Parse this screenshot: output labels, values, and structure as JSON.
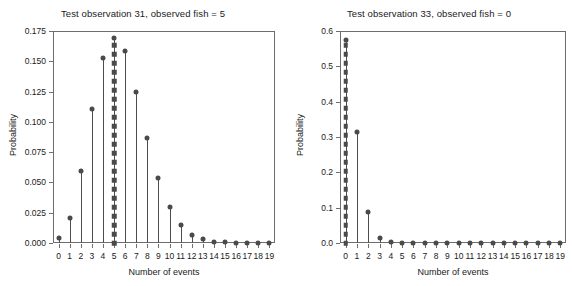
{
  "figure": {
    "width": 572,
    "height": 286,
    "background": "#ffffff",
    "marker_color": "#4a4a4a",
    "stem_color": "#4d4d4d",
    "frame_color": "#6e6e6e"
  },
  "chart_data": [
    {
      "type": "bar",
      "subtype": "stem",
      "title": "Test observation 31, observed fish = 5",
      "xlabel": "Number of events",
      "ylabel": "Probability",
      "grid": false,
      "legend": "none",
      "categories": [
        0,
        1,
        2,
        3,
        4,
        5,
        6,
        7,
        8,
        9,
        10,
        11,
        12,
        13,
        14,
        15,
        16,
        17,
        18,
        19
      ],
      "values": [
        0.0041,
        0.021,
        0.0595,
        0.111,
        0.153,
        0.1695,
        0.1585,
        0.125,
        0.0865,
        0.0535,
        0.0295,
        0.015,
        0.007,
        0.003,
        0.0012,
        0.0005,
        0.0002,
        0.0001,
        0.0,
        0.0
      ],
      "observed_index": 5,
      "observed_label": "observed fish = 5",
      "observed_marker": "square-stack",
      "xlim": [
        -0.5,
        19.5
      ],
      "ylim": [
        0.0,
        0.175
      ],
      "yticks": [
        0.0,
        0.025,
        0.05,
        0.075,
        0.1,
        0.125,
        0.15,
        0.175
      ],
      "ytick_labels": [
        "0.000",
        "0.025",
        "0.050",
        "0.075",
        "0.100",
        "0.125",
        "0.150",
        "0.175"
      ],
      "xticks": [
        0,
        1,
        2,
        3,
        4,
        5,
        6,
        7,
        8,
        9,
        10,
        11,
        12,
        13,
        14,
        15,
        16,
        17,
        18,
        19
      ],
      "xtick_labels": [
        "0",
        "1",
        "2",
        "3",
        "4",
        "5",
        "6",
        "7",
        "8",
        "9",
        "10",
        "11",
        "12",
        "13",
        "14",
        "15",
        "16",
        "17",
        "18",
        "19"
      ]
    },
    {
      "type": "bar",
      "subtype": "stem",
      "title": "Test observation 33, observed fish = 0",
      "xlabel": "Number of events",
      "ylabel": "Probability",
      "grid": false,
      "legend": "none",
      "categories": [
        0,
        1,
        2,
        3,
        4,
        5,
        6,
        7,
        8,
        9,
        10,
        11,
        12,
        13,
        14,
        15,
        16,
        17,
        18,
        19
      ],
      "values": [
        0.575,
        0.315,
        0.087,
        0.015,
        0.002,
        0.0004,
        0.0001,
        0.0,
        0.0,
        0.0,
        0.0,
        0.0,
        0.0,
        0.0,
        0.0,
        0.0,
        0.0,
        0.0,
        0.0,
        0.0
      ],
      "observed_index": 0,
      "observed_label": "observed fish = 0",
      "observed_marker": "square-stack",
      "xlim": [
        -0.5,
        19.5
      ],
      "ylim": [
        0.0,
        0.6
      ],
      "yticks": [
        0.0,
        0.1,
        0.2,
        0.3,
        0.4,
        0.5,
        0.6
      ],
      "ytick_labels": [
        "0.0",
        "0.1",
        "0.2",
        "0.3",
        "0.4",
        "0.5",
        "0.6"
      ],
      "xticks": [
        0,
        1,
        2,
        3,
        4,
        5,
        6,
        7,
        8,
        9,
        10,
        11,
        12,
        13,
        14,
        15,
        16,
        17,
        18,
        19
      ],
      "xtick_labels": [
        "0",
        "1",
        "2",
        "3",
        "4",
        "5",
        "6",
        "7",
        "8",
        "9",
        "10",
        "11",
        "12",
        "13",
        "14",
        "15",
        "16",
        "17",
        "18",
        "19"
      ]
    }
  ]
}
